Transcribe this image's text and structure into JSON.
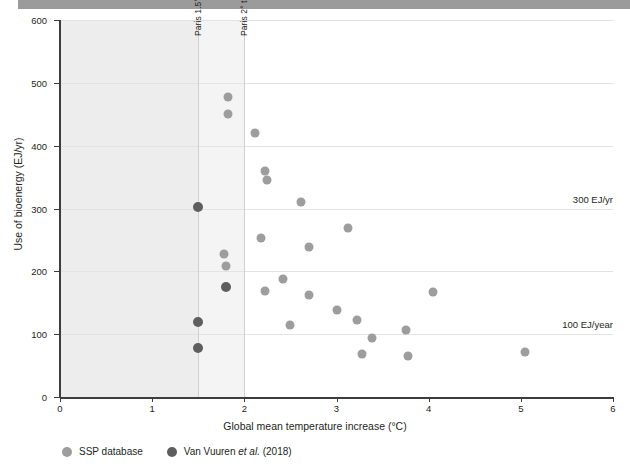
{
  "chart_data": {
    "type": "scatter",
    "title": "",
    "xlabel": "Global mean temperature increase (°C)",
    "ylabel": "Use of bioenergy (EJ/yr)",
    "xlim": [
      0,
      6
    ],
    "ylim": [
      0,
      600
    ],
    "xticks": [
      0,
      1,
      2,
      3,
      4,
      5,
      6
    ],
    "yticks": [
      0,
      100,
      200,
      300,
      400,
      500,
      600
    ],
    "grid": "horizontal",
    "legend_position": "below-axes",
    "series": [
      {
        "name": "SSP database",
        "color": "#9d9d9d",
        "points": [
          {
            "x": 1.82,
            "y": 478
          },
          {
            "x": 1.82,
            "y": 450
          },
          {
            "x": 2.12,
            "y": 420
          },
          {
            "x": 2.22,
            "y": 359
          },
          {
            "x": 2.25,
            "y": 345
          },
          {
            "x": 2.62,
            "y": 310
          },
          {
            "x": 1.78,
            "y": 228
          },
          {
            "x": 1.8,
            "y": 208
          },
          {
            "x": 2.18,
            "y": 253
          },
          {
            "x": 2.7,
            "y": 238
          },
          {
            "x": 3.12,
            "y": 269
          },
          {
            "x": 2.42,
            "y": 188
          },
          {
            "x": 2.22,
            "y": 168
          },
          {
            "x": 2.7,
            "y": 163
          },
          {
            "x": 4.05,
            "y": 167
          },
          {
            "x": 2.5,
            "y": 115
          },
          {
            "x": 3.0,
            "y": 138
          },
          {
            "x": 3.22,
            "y": 123
          },
          {
            "x": 3.38,
            "y": 94
          },
          {
            "x": 3.75,
            "y": 107
          },
          {
            "x": 3.28,
            "y": 69
          },
          {
            "x": 3.78,
            "y": 66
          },
          {
            "x": 5.05,
            "y": 72
          }
        ]
      },
      {
        "name": "Van Vuuren et al. (2018)",
        "color": "#5e5e5e",
        "points": [
          {
            "x": 1.5,
            "y": 302
          },
          {
            "x": 1.8,
            "y": 175
          },
          {
            "x": 1.5,
            "y": 120
          },
          {
            "x": 1.5,
            "y": 78
          }
        ]
      }
    ],
    "vertical_markers": [
      {
        "value": 1.5,
        "label": "Paris 1.5° target"
      },
      {
        "value": 2.0,
        "label": "Paris 2° target"
      }
    ],
    "shaded_bands": [
      {
        "from": 0,
        "to": 1.5,
        "color": "#ededed"
      },
      {
        "from": 1.5,
        "to": 2.0,
        "color": "#f4f4f4"
      }
    ],
    "annotations": [
      {
        "y": 300,
        "text": "300 EJ/yr"
      },
      {
        "y": 100,
        "text": "100 EJ/year"
      }
    ]
  },
  "legend": {
    "items": [
      {
        "label": "SSP database",
        "italic": "",
        "suffix": "",
        "color": "#9d9d9d"
      },
      {
        "label": "Van Vuuren ",
        "italic": "et al.",
        "suffix": " (2018)",
        "color": "#5e5e5e"
      }
    ]
  }
}
